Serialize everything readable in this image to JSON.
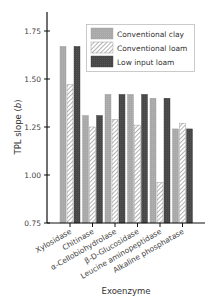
{
  "chart_data": {
    "type": "bar",
    "title": "",
    "xlabel": "Exoenzyme",
    "ylabel": "TPL slope (b)",
    "ylabel_main": "TPL slope (",
    "ylabel_italic": "b",
    "ylabel_end": ")",
    "ylim": [
      0.75,
      1.85
    ],
    "yticks": [
      0.75,
      1.0,
      1.25,
      1.5,
      1.75
    ],
    "ytick_labels": [
      "0.75",
      "1.00",
      "1.25",
      "1.50",
      "1.75"
    ],
    "grid": false,
    "legend_position": "upper right",
    "categories": [
      "Xylosidase",
      "Chitinase",
      "α-Cellobiohydrolase",
      "β-D-Glucosidase",
      "Leucine aminopeptidase",
      "Alkaline phosphatase"
    ],
    "series": [
      {
        "name": "Conventional clay",
        "fill": "#a9a9a9",
        "pattern": "solid",
        "values": [
          1.67,
          1.31,
          1.42,
          1.42,
          1.4,
          1.24
        ]
      },
      {
        "name": "Conventional loam",
        "fill": "#ffffff",
        "pattern": "hatch",
        "values": [
          1.47,
          1.25,
          1.29,
          1.26,
          0.96,
          1.27
        ]
      },
      {
        "name": "Low input loam",
        "fill": "#4a4a4a",
        "pattern": "solid",
        "values": [
          1.67,
          1.31,
          1.42,
          1.42,
          1.4,
          1.24
        ]
      }
    ]
  }
}
